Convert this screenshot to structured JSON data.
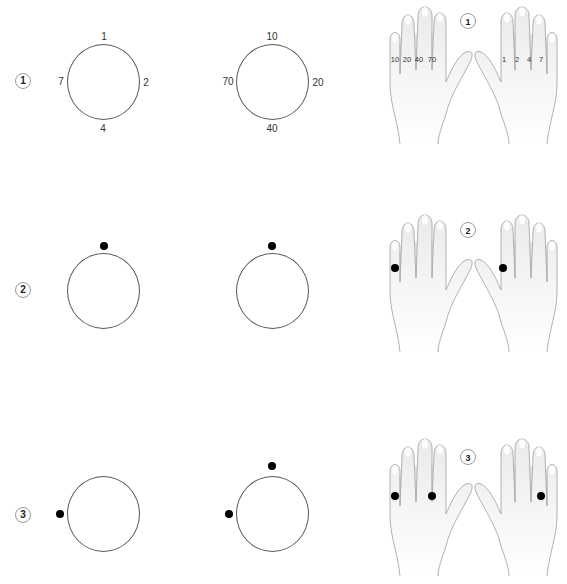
{
  "steps": [
    {
      "number": "1",
      "ones_dial": {
        "top": "1",
        "right": "2",
        "bottom": "4",
        "left": "7",
        "dots": []
      },
      "tens_dial": {
        "top": "10",
        "right": "20",
        "bottom": "40",
        "left": "70",
        "dots": []
      },
      "hands": {
        "badge": "1",
        "left_hand_finger_labels": [
          "10",
          "20",
          "40",
          "70"
        ],
        "right_hand_finger_labels": [
          "1",
          "2",
          "4",
          "7"
        ],
        "left_hand_dots": [],
        "right_hand_dots": []
      }
    },
    {
      "number": "2",
      "ones_dial": {
        "dots": [
          "top"
        ]
      },
      "tens_dial": {
        "dots": [
          "top"
        ]
      },
      "hands": {
        "badge": "2",
        "left_hand_dots": [
          "pinky (10)"
        ],
        "right_hand_dots": [
          "index (1)"
        ]
      }
    },
    {
      "number": "3",
      "ones_dial": {
        "dots": [
          "left"
        ]
      },
      "tens_dial": {
        "dots": [
          "top",
          "left"
        ]
      },
      "hands": {
        "badge": "3",
        "left_hand_dots": [
          "pinky (10)",
          "index (70)"
        ],
        "right_hand_dots": [
          "pinky (7)"
        ]
      }
    }
  ],
  "colors": {
    "dot": "#000000",
    "ring": "#555555",
    "skin": "#f4f4f4",
    "outline": "#a8a8a8"
  }
}
